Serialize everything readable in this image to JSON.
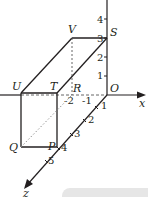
{
  "diagram": {
    "colors": {
      "line": "#231f20",
      "dashed": "#555555",
      "dotted": "#888888",
      "corner_box": "#e6e6e6"
    },
    "axes": {
      "x": {
        "label": "x",
        "ticks": [
          "-2",
          "-1"
        ]
      },
      "y": {
        "ticks": [
          "1",
          "2",
          "3",
          "4"
        ]
      },
      "z": {
        "label": "z",
        "ticks": [
          "1",
          "2",
          "3",
          "4",
          "5"
        ]
      },
      "origin": "O"
    },
    "vertices": {
      "O": "O",
      "P": "P",
      "Q": "Q",
      "R": "R",
      "S": "S",
      "T": "T",
      "U": "U",
      "V": "V"
    }
  }
}
